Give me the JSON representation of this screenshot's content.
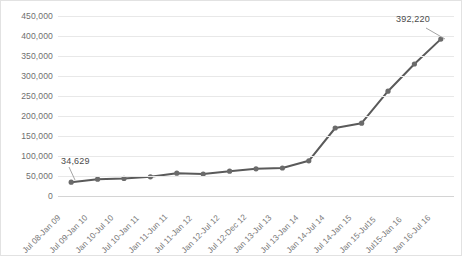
{
  "chart_data": {
    "type": "line",
    "title": "",
    "subtitle": "",
    "xlabel": "",
    "ylabel": "",
    "grid": true,
    "legend": false,
    "ylim": [
      0,
      450000
    ],
    "ytick_step": 50000,
    "ytick_labels": [
      "450,000",
      "400,000",
      "350,000",
      "300,000",
      "250,000",
      "200,000",
      "150,000",
      "100,000",
      "50,000",
      "0"
    ],
    "ytick_values": [
      450000,
      400000,
      350000,
      300000,
      250000,
      200000,
      150000,
      100000,
      50000,
      0
    ],
    "categories": [
      "Jul 08-Jan 09",
      "Jul 09-Jan 10",
      "Jan 10-Jul 10",
      "Jul 10-Jan 11",
      "Jan 11-Jun 11",
      "Jul 11-Jan 12",
      "Jan 12-Jul 12",
      "Jul 12-Dec 12",
      "Jan 13-Jul 13",
      "Jul 13-Jan 14",
      "Jan 14-Jul 14",
      "Jul 14-Jan 15",
      "Jan 15-Jul15",
      "Jul15-Jan 16",
      "Jan 16-Jul 16"
    ],
    "values": [
      34629,
      42000,
      44000,
      48000,
      57000,
      55000,
      62000,
      68000,
      70000,
      88000,
      170000,
      182000,
      262000,
      330000,
      392220
    ],
    "annotations": [
      {
        "name": "first-point-label",
        "text": "34,629",
        "point_index": 0
      },
      {
        "name": "last-point-label",
        "text": "392,220",
        "point_index": 14
      }
    ],
    "series_color": "#5a5a5a",
    "marker_color": "#6b6b6b",
    "gridline_color": "#e8e8e8",
    "border_color": "#e2e2e2",
    "axis_color": "#d4d4d4",
    "tick_text_color": "#6f6f6f"
  }
}
